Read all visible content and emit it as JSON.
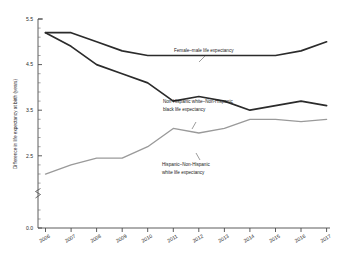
{
  "chart_data": {
    "type": "line",
    "title": "",
    "xlabel": "",
    "ylabel": "Difference in life expectancy at birth (years)",
    "categories": [
      "2006",
      "2007",
      "2008",
      "2009",
      "2010",
      "2011",
      "2012",
      "2013",
      "2014",
      "2015",
      "2016",
      "2017"
    ],
    "x": [
      2006,
      2007,
      2008,
      2009,
      2010,
      2011,
      2012,
      2013,
      2014,
      2015,
      2016,
      2017
    ],
    "xlim": [
      2006,
      2017
    ],
    "ylim": [
      0.0,
      5.5
    ],
    "y_ticks": [
      "0.0",
      "2.5",
      "3.5",
      "4.5",
      "5.5"
    ],
    "y_tick_values": [
      0.0,
      2.5,
      3.5,
      4.5,
      5.5
    ],
    "y_axis_break": true,
    "grid": false,
    "legend_position": "inline-annotations",
    "series": [
      {
        "name": "Female–male life expectancy",
        "color": "#2b2b2b",
        "values": [
          5.2,
          5.2,
          5.0,
          4.8,
          4.7,
          4.7,
          4.7,
          4.7,
          4.7,
          4.7,
          4.8,
          5.0
        ]
      },
      {
        "name": "Non-Hispanic white–Non-Hispanic black life expectancy",
        "color": "#2b2b2b",
        "values": [
          5.2,
          4.9,
          4.5,
          4.3,
          4.1,
          3.7,
          3.8,
          3.7,
          3.5,
          3.6,
          3.7,
          3.6
        ]
      },
      {
        "name": "Hispanic–Non-Hispanic white life expectancy",
        "color": "#9a9a9a",
        "values": [
          2.1,
          2.3,
          2.45,
          2.45,
          2.7,
          3.1,
          3.0,
          3.1,
          3.3,
          3.3,
          3.25,
          3.3
        ]
      }
    ],
    "annotations": [
      {
        "id": "annotation-female-male",
        "line1": "Female–male life expectancy",
        "line2": ""
      },
      {
        "id": "annotation-white-black",
        "line1": "Non-Hispanic white–Non-Hispanic",
        "line2": "black life expectancy"
      },
      {
        "id": "annotation-hispanic-white",
        "line1": "Hispanic–Non-Hispanic",
        "line2": "white life expectancy"
      }
    ]
  }
}
